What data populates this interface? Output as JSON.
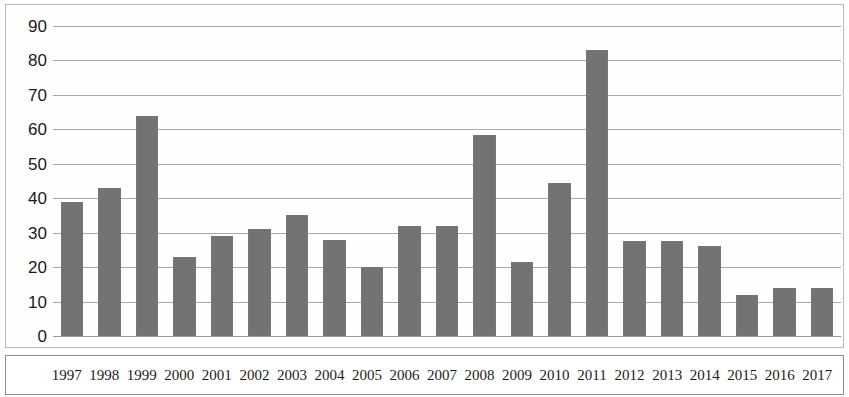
{
  "chart_data": {
    "type": "bar",
    "title": "",
    "subtitle": "",
    "xlabel": "",
    "ylabel": "",
    "categories": [
      "1997",
      "1998",
      "1999",
      "2000",
      "2001",
      "2002",
      "2003",
      "2004",
      "2005",
      "2006",
      "2007",
      "2008",
      "2009",
      "2010",
      "2011",
      "2012",
      "2013",
      "2014",
      "2015",
      "2016",
      "2017"
    ],
    "values": [
      39,
      43,
      64,
      23,
      29,
      31,
      35,
      28,
      20,
      32,
      32,
      58.5,
      21.5,
      44.5,
      83,
      27.5,
      27.5,
      26,
      12,
      14,
      14
    ],
    "series": [
      {
        "name": "",
        "values": [
          39,
          43,
          64,
          23,
          29,
          31,
          35,
          28,
          20,
          32,
          32,
          58.5,
          21.5,
          44.5,
          83,
          27.5,
          27.5,
          26,
          12,
          14,
          14
        ]
      }
    ],
    "ylim": [
      0,
      90
    ],
    "y_ticks": [
      0,
      10,
      20,
      30,
      40,
      50,
      60,
      70,
      80,
      90
    ],
    "y_tick_labels": [
      "0",
      "10",
      "20",
      "30",
      "40",
      "50",
      "60",
      "70",
      "80",
      "90"
    ],
    "grid": true,
    "grid_axis": "y",
    "legend": false,
    "legend_position": "none",
    "bar_color": "#737373",
    "gridline_color": "#a8a8a8",
    "axis_text_color": "#1a1a1a",
    "background_color": "#ffffff",
    "annotations": []
  }
}
